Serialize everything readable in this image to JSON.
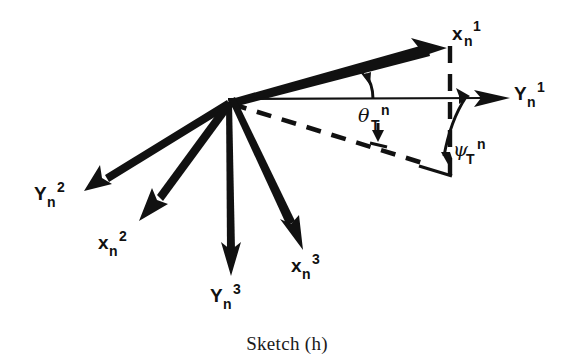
{
  "figure": {
    "caption": "Sketch (h)",
    "background_color": "#ffffff",
    "ink_color": "#111111",
    "origin": {
      "x": 228,
      "y": 102
    }
  },
  "labels": {
    "xn1": {
      "base": "x",
      "sub": "n",
      "sup": "1",
      "x": 455,
      "y": 38
    },
    "yn1": {
      "base": "Y",
      "sub": "n",
      "sup": "1",
      "x": 516,
      "y": 98
    },
    "yn2": {
      "base": "Y",
      "sub": "n",
      "sup": "2",
      "x": 36,
      "y": 198
    },
    "xn2": {
      "base": "x",
      "sub": "n",
      "sup": "2",
      "x": 100,
      "y": 247
    },
    "yn3": {
      "base": "Y",
      "sub": "n",
      "sup": "3",
      "x": 212,
      "y": 300
    },
    "xn3": {
      "base": "x",
      "sub": "n",
      "sup": "3",
      "x": 293,
      "y": 270
    },
    "theta_T_n": {
      "base": "θ",
      "sub": "T",
      "sup": "n",
      "x": 362,
      "y": 119
    },
    "psi_T_n": {
      "base": "ψ",
      "sub": "T",
      "sup": "n",
      "x": 455,
      "y": 153
    }
  },
  "vectors": [
    {
      "name": "xn1",
      "label": "x_n^1",
      "from": [
        228,
        102
      ],
      "to": [
        445,
        48
      ],
      "style": "solid",
      "arrow": "end"
    },
    {
      "name": "yn1",
      "label": "Y_n^1",
      "from": [
        228,
        102
      ],
      "to": [
        508,
        98
      ],
      "style": "solid",
      "arrow": "end"
    },
    {
      "name": "yn2",
      "label": "Y_n^2",
      "from": [
        228,
        102
      ],
      "to": [
        88,
        188
      ],
      "style": "solid",
      "arrow": "end"
    },
    {
      "name": "xn2",
      "label": "x_n^2",
      "from": [
        228,
        102
      ],
      "to": [
        142,
        218
      ],
      "style": "solid",
      "arrow": "end"
    },
    {
      "name": "yn3",
      "label": "Y_n^3",
      "from": [
        228,
        102
      ],
      "to": [
        232,
        272
      ],
      "style": "solid",
      "arrow": "end"
    },
    {
      "name": "xn3",
      "label": "x_n^3",
      "from": [
        228,
        102
      ],
      "to": [
        300,
        248
      ],
      "style": "solid",
      "arrow": "end"
    }
  ],
  "construction": [
    {
      "name": "projection-dashed-ray",
      "from": [
        228,
        102
      ],
      "to": [
        424,
        163
      ],
      "style": "dashed"
    },
    {
      "name": "vertical-dashed-drop",
      "from": [
        450,
        48
      ],
      "to": [
        450,
        174
      ],
      "style": "dashed"
    },
    {
      "name": "triangle-closing-edge",
      "from": [
        424,
        168
      ],
      "to": [
        452,
        174
      ],
      "style": "solid"
    }
  ],
  "angle_arcs": [
    {
      "name": "theta-arc",
      "label": "θ_T^n",
      "between": [
        "Y_n^1",
        "x_n^1"
      ],
      "arrow": "toward x_n^1"
    },
    {
      "name": "theta-indicator",
      "label": "θ_T^n",
      "arrow": "down toward dashed ray"
    },
    {
      "name": "psi-arc",
      "label": "ψ_T^n",
      "between": [
        "Y_n^1",
        "dashed ray"
      ],
      "arrow": "double"
    }
  ]
}
